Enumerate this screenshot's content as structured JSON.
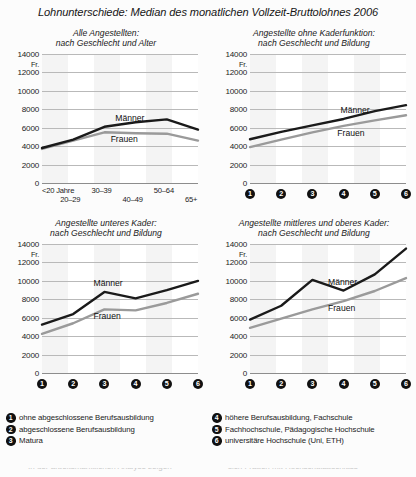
{
  "title": "Lohnunterschiede: Median des monatlichen Vollzeit-Bruttolohnes 2006",
  "axis": {
    "unit": "Fr.",
    "yticks": [
      "14000",
      "12000",
      "10000",
      "8000",
      "6000",
      "4000",
      "2000",
      "0"
    ]
  },
  "series_labels": {
    "men": "Männer",
    "women": "Frauen"
  },
  "colors": {
    "men": "#1a1a1a",
    "women": "#9a9a9a",
    "grid": "#b9b9b9",
    "band": "#f4f4f4",
    "bullet": "#111111"
  },
  "charts": [
    {
      "id": "alle-angestellten",
      "title_line1": "Alle Angestellten:",
      "title_line2": "nach Geschlecht und Alter",
      "xlabels": [
        "<20 Jahre",
        "20–29",
        "30–39",
        "40–49",
        "50–64",
        "65+"
      ],
      "xlabel_style": "age"
    },
    {
      "id": "ohne-kaderfunktion",
      "title_line1": "Angestellte ohne Kaderfunktion:",
      "title_line2": "nach Geschlecht und Bildung",
      "xlabels": [
        "1",
        "2",
        "3",
        "4",
        "5",
        "6"
      ],
      "xlabel_style": "numbered"
    },
    {
      "id": "unteres-kader",
      "title_line1": "Angestellte unteres Kader:",
      "title_line2": "nach Geschlecht und Bildung",
      "xlabels": [
        "1",
        "2",
        "3",
        "4",
        "5",
        "6"
      ],
      "xlabel_style": "numbered"
    },
    {
      "id": "mittleres-oberes-kader",
      "title_line1": "Angestellte mittleres und oberes Kader:",
      "title_line2": "nach Geschlecht und Bildung",
      "xlabels": [
        "1",
        "2",
        "3",
        "4",
        "5",
        "6"
      ],
      "xlabel_style": "numbered"
    }
  ],
  "legend": {
    "left": [
      {
        "num": "1",
        "text": "ohne abgeschlossene Berufsausbildung"
      },
      {
        "num": "2",
        "text": "abgeschlossene Berufsausbildung"
      },
      {
        "num": "3",
        "text": "Matura"
      }
    ],
    "right": [
      {
        "num": "4",
        "text": "höhere Berufsausbildung, Fachschule"
      },
      {
        "num": "5",
        "text": "Fachhochschule, Pädagogische Hochschule"
      },
      {
        "num": "6",
        "text": "universitäre Hochschule (Uni, ETH)"
      }
    ]
  },
  "chart_data": [
    {
      "type": "line",
      "title": "Alle Angestellten: nach Geschlecht und Alter",
      "xlabel": "",
      "ylabel": "Fr.",
      "ylim": [
        0,
        14000
      ],
      "ytick_step": 2000,
      "grid": true,
      "legend_position": "inline-annotation",
      "categories": [
        "<20 Jahre",
        "20–29",
        "30–39",
        "40–49",
        "50–64",
        "65+"
      ],
      "series": [
        {
          "name": "Männer",
          "values": [
            3800,
            4700,
            6100,
            6600,
            6900,
            5800
          ]
        },
        {
          "name": "Frauen",
          "values": [
            3700,
            4600,
            5500,
            5400,
            5350,
            4600
          ]
        }
      ]
    },
    {
      "type": "line",
      "title": "Angestellte ohne Kaderfunktion: nach Geschlecht und Bildung",
      "xlabel": "",
      "ylabel": "Fr.",
      "ylim": [
        0,
        14000
      ],
      "ytick_step": 2000,
      "grid": true,
      "legend_position": "inline-annotation",
      "categories": [
        "1",
        "2",
        "3",
        "4",
        "5",
        "6"
      ],
      "series": [
        {
          "name": "Männer",
          "values": [
            4750,
            5550,
            6250,
            6950,
            7800,
            8450
          ]
        },
        {
          "name": "Frauen",
          "values": [
            3900,
            4700,
            5500,
            6200,
            6800,
            7350
          ]
        }
      ]
    },
    {
      "type": "line",
      "title": "Angestellte unteres Kader: nach Geschlecht und Bildung",
      "xlabel": "",
      "ylabel": "Fr.",
      "ylim": [
        0,
        14000
      ],
      "ytick_step": 2000,
      "grid": true,
      "legend_position": "inline-annotation",
      "categories": [
        "1",
        "2",
        "3",
        "4",
        "5",
        "6"
      ],
      "series": [
        {
          "name": "Männer",
          "values": [
            5250,
            6400,
            8800,
            8100,
            9000,
            10000
          ]
        },
        {
          "name": "Frauen",
          "values": [
            4250,
            5400,
            6900,
            6800,
            7600,
            8600
          ]
        }
      ]
    },
    {
      "type": "line",
      "title": "Angestellte mittleres und oberes Kader: nach Geschlecht und Bildung",
      "xlabel": "",
      "ylabel": "Fr.",
      "ylim": [
        0,
        14000
      ],
      "ytick_step": 2000,
      "grid": true,
      "legend_position": "inline-annotation",
      "categories": [
        "1",
        "2",
        "3",
        "4",
        "5",
        "6"
      ],
      "series": [
        {
          "name": "Männer",
          "values": [
            5800,
            7300,
            10100,
            8950,
            10700,
            13500
          ]
        },
        {
          "name": "Frauen",
          "values": [
            4900,
            5900,
            6900,
            7800,
            8900,
            10300
          ]
        }
      ]
    }
  ]
}
